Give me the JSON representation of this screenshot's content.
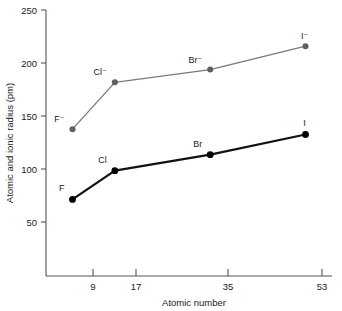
{
  "chart_data": {
    "type": "line",
    "title": "",
    "xlabel": "Atomic number",
    "ylabel": "Atomic and ionic radius (pm)",
    "x": [
      9,
      17,
      35,
      53
    ],
    "xlim": [
      4,
      58
    ],
    "ylim": [
      0,
      250
    ],
    "xticks": [
      9,
      17,
      35,
      53
    ],
    "xtick_labels": [
      "9",
      "17",
      "35",
      "53"
    ],
    "yticks": [
      50,
      100,
      150,
      200,
      250
    ],
    "ytick_labels": [
      "50",
      "100",
      "150",
      "200",
      "250"
    ],
    "grid": false,
    "legend": "none",
    "series": [
      {
        "name": "Ionic radius",
        "color": "#7a7a7a",
        "values": [
          138,
          182,
          194,
          216
        ],
        "point_labels": [
          "F⁻",
          "Cl⁻",
          "Br⁻",
          "I⁻"
        ]
      },
      {
        "name": "Atomic radius",
        "color": "#111111",
        "values": [
          72,
          99,
          114,
          133
        ],
        "point_labels": [
          "F",
          "Cl",
          "Br",
          "I"
        ]
      }
    ]
  },
  "axes": {
    "x_title": "Atomic number",
    "y_title": "Atomic and ionic radius (pm)"
  }
}
